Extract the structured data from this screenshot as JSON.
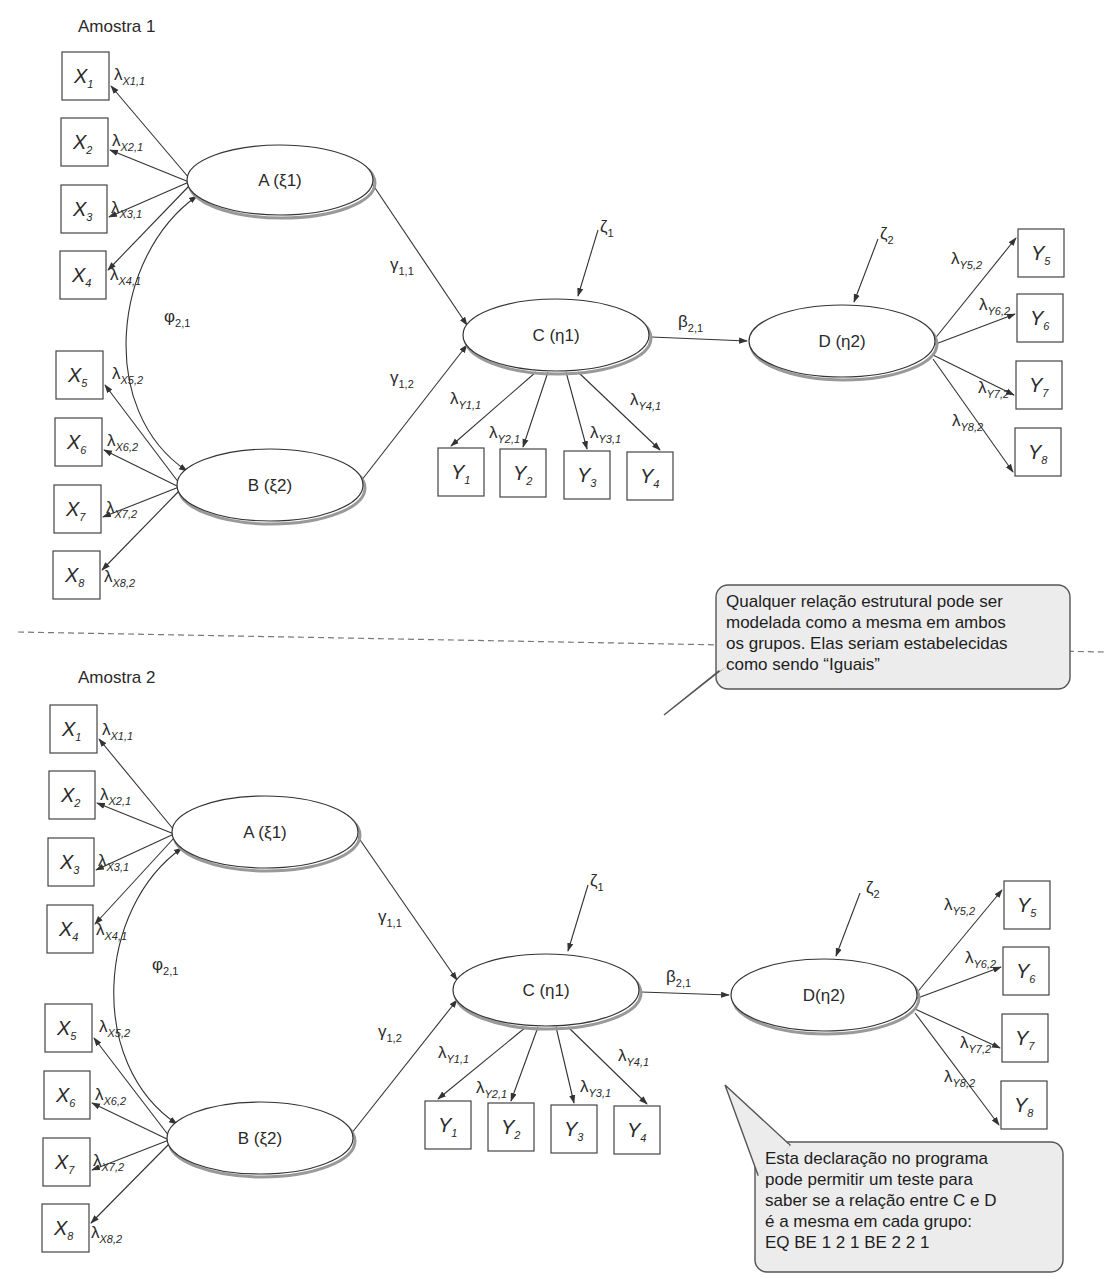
{
  "samples": [
    {
      "title": "Amostra 1",
      "title_pos": [
        78,
        32
      ],
      "latents": {
        "A": {
          "label": "A (ξ1)",
          "cx": 280,
          "cy": 180,
          "rx": 93,
          "ry": 35
        },
        "B": {
          "label": "B (ξ2)",
          "cx": 270,
          "cy": 485,
          "rx": 93,
          "ry": 36
        },
        "C": {
          "label": "C (η1)",
          "cx": 556,
          "cy": 335,
          "rx": 93,
          "ry": 36
        },
        "D": {
          "label": "D (η2)",
          "cx": 842,
          "cy": 341,
          "rx": 93,
          "ry": 36
        }
      },
      "x_indicators": [
        {
          "name": "X",
          "sub": "1",
          "x": 62,
          "y": 52,
          "w": 47,
          "h": 48,
          "load": "λ",
          "load_sub": "X1,1",
          "lx": 114,
          "ly": 80
        },
        {
          "name": "X",
          "sub": "2",
          "x": 61,
          "y": 118,
          "w": 47,
          "h": 48,
          "load": "λ",
          "load_sub": "X2,1",
          "lx": 112,
          "ly": 146
        },
        {
          "name": "X",
          "sub": "3",
          "x": 61,
          "y": 185,
          "w": 46,
          "h": 48,
          "load": "λ",
          "load_sub": "X3,1",
          "lx": 111,
          "ly": 213
        },
        {
          "name": "X",
          "sub": "4",
          "x": 60,
          "y": 251,
          "w": 46,
          "h": 48,
          "load": "λ",
          "load_sub": "X4,1",
          "lx": 110,
          "ly": 280
        },
        {
          "name": "X",
          "sub": "5",
          "x": 56,
          "y": 351,
          "w": 47,
          "h": 48,
          "load": "λ",
          "load_sub": "X5,2",
          "lx": 112,
          "ly": 379
        },
        {
          "name": "X",
          "sub": "6",
          "x": 55,
          "y": 418,
          "w": 47,
          "h": 48,
          "load": "λ",
          "load_sub": "X6,2",
          "lx": 107,
          "ly": 446
        },
        {
          "name": "X",
          "sub": "7",
          "x": 54,
          "y": 485,
          "w": 47,
          "h": 48,
          "load": "λ",
          "load_sub": "X7,2",
          "lx": 106,
          "ly": 513
        },
        {
          "name": "X",
          "sub": "8",
          "x": 53,
          "y": 551,
          "w": 47,
          "h": 48,
          "load": "λ",
          "load_sub": "X8,2",
          "lx": 104,
          "ly": 582
        }
      ],
      "y_indicators": [
        {
          "name": "Y",
          "sub": "1",
          "x": 438,
          "y": 448,
          "w": 46,
          "h": 48,
          "load": "λ",
          "load_sub": "Y1,1",
          "lx": 450,
          "ly": 404
        },
        {
          "name": "Y",
          "sub": "2",
          "x": 500,
          "y": 449,
          "w": 46,
          "h": 48,
          "load": "λ",
          "load_sub": "Y2,1",
          "lx": 489,
          "ly": 438
        },
        {
          "name": "Y",
          "sub": "3",
          "x": 564,
          "y": 451,
          "w": 46,
          "h": 48,
          "load": "λ",
          "load_sub": "Y3,1",
          "lx": 590,
          "ly": 438
        },
        {
          "name": "Y",
          "sub": "4",
          "x": 627,
          "y": 452,
          "w": 46,
          "h": 48,
          "load": "λ",
          "load_sub": "Y4,1",
          "lx": 630,
          "ly": 405
        },
        {
          "name": "Y",
          "sub": "5",
          "x": 1018,
          "y": 229,
          "w": 46,
          "h": 48,
          "load": "λ",
          "load_sub": "Y5,2",
          "lx": 951,
          "ly": 264
        },
        {
          "name": "Y",
          "sub": "6",
          "x": 1017,
          "y": 294,
          "w": 46,
          "h": 48,
          "load": "λ",
          "load_sub": "Y6,2",
          "lx": 979,
          "ly": 310
        },
        {
          "name": "Y",
          "sub": "7",
          "x": 1016,
          "y": 361,
          "w": 46,
          "h": 48,
          "load": "λ",
          "load_sub": "Y7,2",
          "lx": 978,
          "ly": 393
        },
        {
          "name": "Y",
          "sub": "8",
          "x": 1015,
          "y": 428,
          "w": 46,
          "h": 48,
          "load": "λ",
          "load_sub": "Y8,2",
          "lx": 952,
          "ly": 426
        }
      ],
      "paths": {
        "gamma11": {
          "label": "γ",
          "sub": "1,1",
          "lx": 390,
          "ly": 270
        },
        "gamma12": {
          "label": "γ",
          "sub": "1,2",
          "lx": 390,
          "ly": 383
        },
        "phi21": {
          "label": "φ",
          "sub": "2,1",
          "lx": 164,
          "ly": 322
        },
        "beta21": {
          "label": "β",
          "sub": "2,1",
          "lx": 678,
          "ly": 327
        },
        "zeta1": {
          "label": "ζ",
          "sub": "1",
          "lx": 600,
          "ly": 232
        },
        "zeta2": {
          "label": "ζ",
          "sub": "2",
          "lx": 880,
          "ly": 239
        }
      }
    },
    {
      "title": "Amostra 2",
      "title_pos": [
        78,
        683
      ],
      "latents": {
        "A": {
          "label": "A (ξ1)",
          "cx": 265,
          "cy": 832,
          "rx": 93,
          "ry": 36
        },
        "B": {
          "label": "B (ξ2)",
          "cx": 260,
          "cy": 1138,
          "rx": 93,
          "ry": 36
        },
        "C": {
          "label": "C (η1)",
          "cx": 546,
          "cy": 990,
          "rx": 93,
          "ry": 36
        },
        "D": {
          "label": "D(η2)",
          "cx": 824,
          "cy": 995,
          "rx": 93,
          "ry": 36
        }
      },
      "x_indicators": [
        {
          "name": "X",
          "sub": "1",
          "x": 50,
          "y": 705,
          "w": 47,
          "h": 48,
          "load": "λ",
          "load_sub": "X1,1",
          "lx": 102,
          "ly": 735
        },
        {
          "name": "X",
          "sub": "2",
          "x": 49,
          "y": 771,
          "w": 46,
          "h": 48,
          "load": "λ",
          "load_sub": "X2,1",
          "lx": 100,
          "ly": 800
        },
        {
          "name": "X",
          "sub": "3",
          "x": 48,
          "y": 838,
          "w": 46,
          "h": 48,
          "load": "λ",
          "load_sub": "X3,1",
          "lx": 98,
          "ly": 866
        },
        {
          "name": "X",
          "sub": "4",
          "x": 47,
          "y": 905,
          "w": 46,
          "h": 48,
          "load": "λ",
          "load_sub": "X4,1",
          "lx": 96,
          "ly": 935
        },
        {
          "name": "X",
          "sub": "5",
          "x": 45,
          "y": 1004,
          "w": 47,
          "h": 48,
          "load": "λ",
          "load_sub": "X5,2",
          "lx": 99,
          "ly": 1032
        },
        {
          "name": "X",
          "sub": "6",
          "x": 44,
          "y": 1071,
          "w": 46,
          "h": 48,
          "load": "λ",
          "load_sub": "X6,2",
          "lx": 95,
          "ly": 1100
        },
        {
          "name": "X",
          "sub": "7",
          "x": 43,
          "y": 1138,
          "w": 47,
          "h": 48,
          "load": "λ",
          "load_sub": "X7,2",
          "lx": 93,
          "ly": 1166
        },
        {
          "name": "X",
          "sub": "8",
          "x": 42,
          "y": 1204,
          "w": 47,
          "h": 48,
          "load": "λ",
          "load_sub": "X8,2",
          "lx": 91,
          "ly": 1238
        }
      ],
      "y_indicators": [
        {
          "name": "Y",
          "sub": "1",
          "x": 425,
          "y": 1101,
          "w": 46,
          "h": 48,
          "load": "λ",
          "load_sub": "Y1,1",
          "lx": 438,
          "ly": 1058
        },
        {
          "name": "Y",
          "sub": "2",
          "x": 488,
          "y": 1103,
          "w": 46,
          "h": 48,
          "load": "λ",
          "load_sub": "Y2,1",
          "lx": 476,
          "ly": 1093
        },
        {
          "name": "Y",
          "sub": "3",
          "x": 551,
          "y": 1105,
          "w": 46,
          "h": 48,
          "load": "λ",
          "load_sub": "Y3,1",
          "lx": 580,
          "ly": 1092
        },
        {
          "name": "Y",
          "sub": "4",
          "x": 614,
          "y": 1106,
          "w": 46,
          "h": 48,
          "load": "λ",
          "load_sub": "Y4,1",
          "lx": 618,
          "ly": 1061
        },
        {
          "name": "Y",
          "sub": "5",
          "x": 1004,
          "y": 881,
          "w": 46,
          "h": 48,
          "load": "λ",
          "load_sub": "Y5,2",
          "lx": 944,
          "ly": 910
        },
        {
          "name": "Y",
          "sub": "6",
          "x": 1003,
          "y": 947,
          "w": 46,
          "h": 48,
          "load": "λ",
          "load_sub": "Y6,2",
          "lx": 965,
          "ly": 963
        },
        {
          "name": "Y",
          "sub": "7",
          "x": 1002,
          "y": 1014,
          "w": 46,
          "h": 48,
          "load": "λ",
          "load_sub": "Y7,2",
          "lx": 960,
          "ly": 1048
        },
        {
          "name": "Y",
          "sub": "8",
          "x": 1001,
          "y": 1081,
          "w": 46,
          "h": 48,
          "load": "λ",
          "load_sub": "Y8,2",
          "lx": 944,
          "ly": 1082
        }
      ],
      "paths": {
        "gamma11": {
          "label": "γ",
          "sub": "1,1",
          "lx": 378,
          "ly": 922
        },
        "gamma12": {
          "label": "γ",
          "sub": "1,2",
          "lx": 378,
          "ly": 1037
        },
        "phi21": {
          "label": "φ",
          "sub": "2,1",
          "lx": 152,
          "ly": 970
        },
        "beta21": {
          "label": "β",
          "sub": "2,1",
          "lx": 666,
          "ly": 982
        },
        "zeta1": {
          "label": "ζ",
          "sub": "1",
          "lx": 590,
          "ly": 886
        },
        "zeta2": {
          "label": "ζ",
          "sub": "2",
          "lx": 866,
          "ly": 893
        }
      }
    }
  ],
  "separator": {
    "y": 632
  },
  "callouts": [
    {
      "id": "callout-equal-structural",
      "lines": [
        "Qualquer relação estrutural pode ser",
        "modelada como a mesma em ambos",
        "os grupos. Elas seriam estabelecidas",
        "como sendo “Iguais”"
      ],
      "x": 716,
      "y": 585,
      "w": 354,
      "h": 104,
      "pointer": [
        [
          740,
          655
        ],
        [
          664,
          715
        ],
        [
          720,
          670
        ]
      ]
    },
    {
      "id": "callout-eq-statement",
      "lines": [
        "Esta declaração no programa",
        "pode permitir um teste para",
        "saber se a relação entre C e D",
        "é a mesma em cada grupo:",
        "EQ BE 1 2 1 BE 2 2 1"
      ],
      "x": 755,
      "y": 1142,
      "w": 308,
      "h": 130,
      "pointer": [
        [
          758,
          1175
        ],
        [
          725,
          1085
        ],
        [
          790,
          1145
        ]
      ]
    }
  ]
}
